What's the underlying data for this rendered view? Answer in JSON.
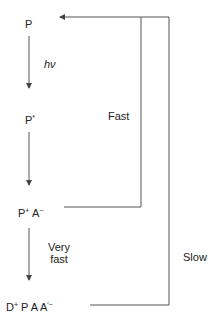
{
  "states": {
    "ground": {
      "base": "P",
      "sup": ""
    },
    "excited": {
      "base": "P",
      "sup": "*"
    },
    "charge_sep_1": {
      "p": "P",
      "p_sup": "+",
      "a": "A",
      "a_sup": "−"
    },
    "charge_sep_2": {
      "d": "D",
      "d_sup": "+",
      "rest": "P A A",
      "a_sup": "′−"
    }
  },
  "transitions": {
    "excitation": "hν",
    "fast": "Fast",
    "very_fast_line1": "Very",
    "very_fast_line2": "fast",
    "slow": "Slow"
  },
  "colors": {
    "line": "#555555",
    "text": "#222222"
  }
}
